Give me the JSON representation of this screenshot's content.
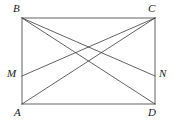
{
  "figure": {
    "width": 172,
    "height": 122,
    "background_color": "#ffffff",
    "stroke_color": "#3a3a3a",
    "label_color": "#1a1a1a",
    "stroke_width": 0.8
  },
  "points": {
    "B": {
      "label": "B",
      "x": 22,
      "y": 18,
      "label_x": 13,
      "label_y": 3
    },
    "C": {
      "label": "C",
      "x": 155,
      "y": 18,
      "label_x": 148,
      "label_y": 3
    },
    "A": {
      "label": "A",
      "x": 22,
      "y": 104,
      "label_x": 14,
      "label_y": 107
    },
    "D": {
      "label": "D",
      "x": 155,
      "y": 104,
      "label_x": 148,
      "label_y": 107
    },
    "M": {
      "label": "M",
      "x": 22,
      "y": 76,
      "label_x": 7,
      "label_y": 68
    },
    "N": {
      "label": "N",
      "x": 155,
      "y": 76,
      "label_x": 159,
      "label_y": 68
    }
  },
  "segments": [
    {
      "name": "side-BC",
      "from": "B",
      "to": "C"
    },
    {
      "name": "side-CD",
      "from": "C",
      "to": "D"
    },
    {
      "name": "side-DA",
      "from": "D",
      "to": "A"
    },
    {
      "name": "side-AB",
      "from": "A",
      "to": "B"
    },
    {
      "name": "diagonal-AC",
      "from": "A",
      "to": "C"
    },
    {
      "name": "diagonal-BD",
      "from": "B",
      "to": "D"
    },
    {
      "name": "segment-BN",
      "from": "B",
      "to": "N"
    },
    {
      "name": "segment-MC",
      "from": "M",
      "to": "C"
    }
  ]
}
